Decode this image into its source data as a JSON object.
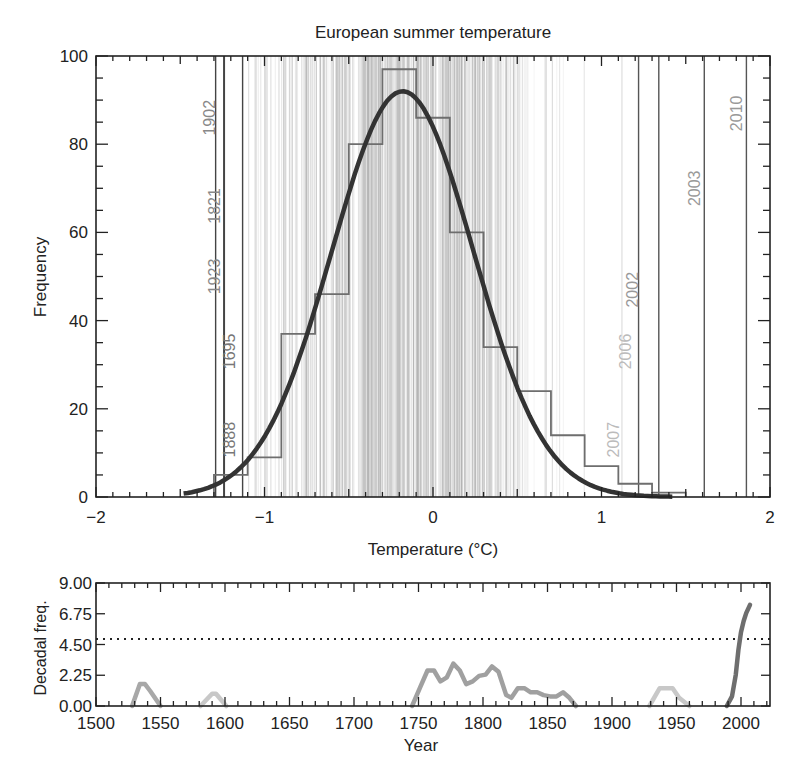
{
  "chart_data": [
    {
      "id": "histogram",
      "type": "bar",
      "title": "European summer temperature",
      "xlabel": "Temperature (°C)",
      "ylabel": "Frequency",
      "xlim": [
        -2,
        2
      ],
      "ylim": [
        0,
        100
      ],
      "x_ticks": [
        -2,
        -1,
        0,
        1,
        2
      ],
      "x_tick_labels": [
        "−2",
        "−1",
        "0",
        "1",
        "2"
      ],
      "y_ticks": [
        0,
        20,
        40,
        60,
        80,
        100
      ],
      "y_tick_labels": [
        "0",
        "20",
        "40",
        "60",
        "80",
        "100"
      ],
      "grid": false,
      "histogram": {
        "bin_edges": [
          -1.3,
          -1.1,
          -0.9,
          -0.7,
          -0.5,
          -0.3,
          -0.1,
          0.1,
          0.3,
          0.5,
          0.7,
          0.9,
          1.1,
          1.3,
          1.5
        ],
        "counts": [
          5,
          9,
          37,
          46,
          80,
          97,
          86,
          60,
          34,
          24,
          14,
          7,
          3,
          1
        ],
        "color": "#6e6e6e"
      },
      "fit_curve": {
        "type": "gaussian",
        "peak": 92,
        "mean": -0.18,
        "sd": 0.42,
        "x_range": [
          -1.48,
          1.42
        ],
        "color": "#333333"
      },
      "annotated_years": [
        {
          "year": "1902",
          "temp": -1.27,
          "label_y": 86,
          "color": "#888888"
        },
        {
          "year": "1821",
          "temp": -1.24,
          "label_y": 66,
          "color": "#888888"
        },
        {
          "year": "1923",
          "temp": -1.24,
          "label_y": 50,
          "color": "#888888"
        },
        {
          "year": "1695",
          "temp": -1.15,
          "label_y": 33,
          "color": "#777777"
        },
        {
          "year": "1888",
          "temp": -1.15,
          "label_y": 13,
          "color": "#777777"
        },
        {
          "year": "2007",
          "temp": 1.13,
          "label_y": 13,
          "color": "#bbbbbb"
        },
        {
          "year": "2006",
          "temp": 1.2,
          "label_y": 33,
          "color": "#bbbbbb"
        },
        {
          "year": "2002",
          "temp": 1.24,
          "label_y": 47,
          "color": "#999999"
        },
        {
          "year": "2003",
          "temp": 1.61,
          "label_y": 70,
          "color": "#999999"
        },
        {
          "year": "2010",
          "temp": 1.86,
          "label_y": 87,
          "color": "#999999"
        }
      ],
      "strong_year_lines": [
        -1.29,
        -1.24,
        -1.13,
        1.22,
        1.34,
        1.61,
        1.86
      ]
    },
    {
      "id": "decadal",
      "type": "line",
      "title": "",
      "xlabel": "Year",
      "ylabel": "Decadal freq.",
      "xlim": [
        1500,
        2020
      ],
      "ylim": [
        0,
        9
      ],
      "x_ticks": [
        1500,
        1550,
        1600,
        1650,
        1700,
        1750,
        1800,
        1850,
        1900,
        1950,
        2000
      ],
      "x_tick_labels": [
        "1500",
        "1550",
        "1600",
        "1650",
        "1700",
        "1750",
        "1800",
        "1850",
        "1900",
        "1950",
        "2000"
      ],
      "y_ticks": [
        0,
        2.25,
        4.5,
        6.75,
        9
      ],
      "y_tick_labels": [
        "0.00",
        "2.25",
        "4.50",
        "6.75",
        "9.00"
      ],
      "threshold": {
        "value": 4.9,
        "style": "dotted"
      },
      "grid": false,
      "series": [
        {
          "name": "decadal frequency 1525-1560",
          "color": "#a8a8a8",
          "x": [
            1528,
            1534,
            1538,
            1542,
            1550
          ],
          "y": [
            0,
            1.6,
            1.6,
            1.1,
            0
          ]
        },
        {
          "name": "decadal frequency 1580-1602",
          "color": "#c8c8c8",
          "x": [
            1581,
            1590,
            1593,
            1601
          ],
          "y": [
            0,
            0.9,
            0.9,
            0
          ]
        },
        {
          "name": "decadal frequency 1745-1872",
          "color": "#a0a0a0",
          "x": [
            1745,
            1751,
            1757,
            1762,
            1767,
            1772,
            1777,
            1782,
            1787,
            1792,
            1797,
            1802,
            1807,
            1812,
            1818,
            1822,
            1827,
            1832,
            1837,
            1842,
            1847,
            1852,
            1857,
            1862,
            1867,
            1872
          ],
          "y": [
            0,
            1.3,
            2.6,
            2.6,
            1.8,
            2.1,
            3.1,
            2.6,
            1.6,
            1.8,
            2.2,
            2.3,
            2.9,
            2.5,
            0.8,
            0.6,
            1.3,
            1.3,
            1.0,
            1.0,
            0.8,
            0.7,
            0.7,
            1.0,
            0.6,
            0
          ]
        },
        {
          "name": "decadal frequency 1930-1960",
          "color": "#c8c8c8",
          "x": [
            1929,
            1937,
            1947,
            1952,
            1960
          ],
          "y": [
            0,
            1.3,
            1.3,
            0.6,
            0
          ]
        },
        {
          "name": "decadal frequency 1990-2008",
          "color": "#6e6e6e",
          "x": [
            1989,
            1993,
            1996,
            1998,
            2000,
            2002,
            2004,
            2007
          ],
          "y": [
            0,
            0.7,
            2.3,
            4.1,
            5.4,
            6.2,
            6.8,
            7.4
          ]
        }
      ]
    }
  ]
}
